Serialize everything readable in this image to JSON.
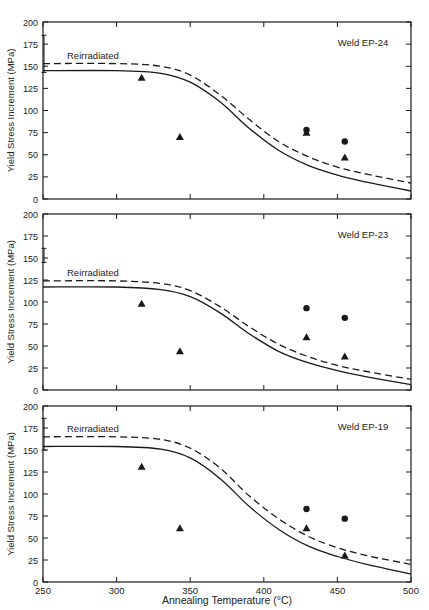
{
  "figure": {
    "xlabel": "Annealing Temperature (°C)",
    "ylabel": "Yield Stress Increment (MPa)",
    "curve_label": "Reirradiated"
  },
  "chart_data": [
    {
      "type": "line",
      "title": "Weld EP-24",
      "xlabel": "Annealing Temperature (°C)",
      "ylabel": "Yield Stress Increment (MPa)",
      "xlim": [
        250,
        500
      ],
      "ylim": [
        0,
        200
      ],
      "xticks": [
        250,
        300,
        350,
        400,
        450,
        500
      ],
      "yticks": [
        0,
        25,
        50,
        75,
        100,
        125,
        150,
        175,
        200
      ],
      "grid": false,
      "annotation": "Reirradiated",
      "series": [
        {
          "name": "Recovery curve (solid)",
          "style": "solid",
          "x": [
            250,
            300,
            330,
            350,
            370,
            390,
            410,
            430,
            450,
            470,
            500
          ],
          "y": [
            145,
            145,
            142,
            132,
            110,
            80,
            55,
            38,
            27,
            19,
            9
          ]
        },
        {
          "name": "Reirradiated (dashed)",
          "style": "dashed",
          "x": [
            250,
            300,
            330,
            350,
            370,
            390,
            410,
            430,
            450,
            470,
            500
          ],
          "y": [
            153,
            153,
            150,
            140,
            118,
            90,
            65,
            48,
            36,
            28,
            18
          ]
        },
        {
          "name": "Triangles",
          "marker": "triangle",
          "x": [
            317,
            343,
            429,
            455
          ],
          "y": [
            137,
            70,
            75,
            47
          ]
        },
        {
          "name": "Circles",
          "marker": "circle",
          "x": [
            429,
            455
          ],
          "y": [
            78,
            65
          ]
        },
        {
          "name": "Error bar at 250",
          "marker": "errorbar",
          "x": [
            250
          ],
          "y_low": [
            143
          ],
          "y_high": [
            185
          ]
        }
      ]
    },
    {
      "type": "line",
      "title": "Weld EP-23",
      "xlabel": "Annealing Temperature (°C)",
      "ylabel": "Yield Stress Increment (MPa)",
      "xlim": [
        250,
        500
      ],
      "ylim": [
        0,
        200
      ],
      "xticks": [
        250,
        300,
        350,
        400,
        450,
        500
      ],
      "yticks": [
        0,
        25,
        50,
        75,
        100,
        125,
        150,
        175,
        200
      ],
      "grid": false,
      "annotation": "Reirradiated",
      "series": [
        {
          "name": "Recovery curve (solid)",
          "style": "solid",
          "x": [
            250,
            300,
            330,
            350,
            370,
            390,
            410,
            430,
            450,
            470,
            500
          ],
          "y": [
            117,
            117,
            114,
            106,
            88,
            64,
            44,
            31,
            22,
            15,
            6
          ]
        },
        {
          "name": "Reirradiated (dashed)",
          "style": "dashed",
          "x": [
            250,
            300,
            330,
            350,
            370,
            390,
            410,
            430,
            450,
            470,
            500
          ],
          "y": [
            124,
            124,
            121,
            113,
            95,
            72,
            52,
            38,
            28,
            21,
            12
          ]
        },
        {
          "name": "Triangles",
          "marker": "triangle",
          "x": [
            317,
            343,
            429,
            455
          ],
          "y": [
            98,
            44,
            60,
            38
          ]
        },
        {
          "name": "Circles",
          "marker": "circle",
          "x": [
            429,
            455
          ],
          "y": [
            93,
            82
          ]
        },
        {
          "name": "Error bar at 250",
          "marker": "errorbar",
          "x": [
            250
          ],
          "y_low": [
            145
          ],
          "y_high": [
            161
          ]
        }
      ]
    },
    {
      "type": "line",
      "title": "Weld EP-19",
      "xlabel": "Annealing Temperature (°C)",
      "ylabel": "Yield Stress Increment (MPa)",
      "xlim": [
        250,
        500
      ],
      "ylim": [
        0,
        200
      ],
      "xticks": [
        250,
        300,
        350,
        400,
        450,
        500
      ],
      "yticks": [
        0,
        25,
        50,
        75,
        100,
        125,
        150,
        175,
        200
      ],
      "grid": false,
      "annotation": "Reirradiated",
      "series": [
        {
          "name": "Recovery curve (solid)",
          "style": "solid",
          "x": [
            250,
            300,
            330,
            350,
            370,
            390,
            410,
            430,
            450,
            470,
            500
          ],
          "y": [
            154,
            154,
            151,
            141,
            118,
            86,
            60,
            41,
            29,
            20,
            9
          ]
        },
        {
          "name": "Reirradiated (dashed)",
          "style": "dashed",
          "x": [
            250,
            300,
            330,
            350,
            370,
            390,
            410,
            430,
            450,
            470,
            500
          ],
          "y": [
            165,
            165,
            162,
            152,
            130,
            98,
            72,
            52,
            39,
            30,
            20
          ]
        },
        {
          "name": "Triangles",
          "marker": "triangle",
          "x": [
            317,
            343,
            429,
            455
          ],
          "y": [
            131,
            61,
            61,
            30
          ]
        },
        {
          "name": "Circles",
          "marker": "circle",
          "x": [
            429,
            455
          ],
          "y": [
            83,
            72
          ]
        },
        {
          "name": "Error bar at 250",
          "marker": "errorbar",
          "x": [
            250
          ],
          "y_low": [
            150
          ],
          "y_high": [
            186
          ]
        }
      ]
    }
  ],
  "layout": {
    "plot_left": 43,
    "plot_right": 411,
    "panels": [
      {
        "top": 22,
        "bottom": 199
      },
      {
        "top": 214,
        "bottom": 390
      },
      {
        "top": 406,
        "bottom": 582
      }
    ],
    "ink": "#1a1a1a"
  }
}
